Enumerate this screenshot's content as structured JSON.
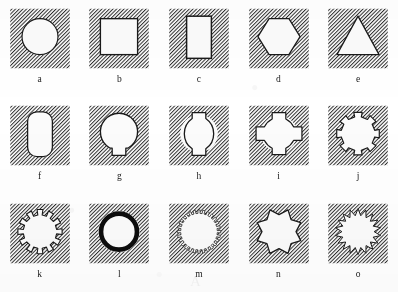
{
  "figure": {
    "rows": 3,
    "columns": 5,
    "background_color": "#ffffff",
    "hatch_color": "#2b2b2b",
    "outline_color": "#1a1a1a",
    "fill_color": "#fbfbfb"
  },
  "panels": [
    {
      "label": "a",
      "shape": "circle",
      "name": "circular-hole"
    },
    {
      "label": "b",
      "shape": "square",
      "name": "square-hole"
    },
    {
      "label": "c",
      "shape": "rectangle-vertical",
      "name": "vertical-rectangular-hole"
    },
    {
      "label": "d",
      "shape": "hexagon",
      "name": "hexagonal-hole"
    },
    {
      "label": "e",
      "shape": "triangle",
      "name": "triangular-hole"
    },
    {
      "label": "f",
      "shape": "rounded-rectangle",
      "name": "rounded-rectangular-hole"
    },
    {
      "label": "g",
      "shape": "circle-with-tab",
      "name": "keyhole-hole"
    },
    {
      "label": "h",
      "shape": "circle-two-tabs",
      "name": "two-keyway-hole"
    },
    {
      "label": "i",
      "shape": "circle-four-lobes",
      "name": "four-keyway-hole"
    },
    {
      "label": "j",
      "shape": "circle-eight-lobes",
      "name": "eight-keyway-hole"
    },
    {
      "label": "k",
      "shape": "gear-twelve",
      "name": "twelve-tooth-gear-hole"
    },
    {
      "label": "l",
      "shape": "thick-ring",
      "name": "thick-walled-ring"
    },
    {
      "label": "m",
      "shape": "gear-fine",
      "name": "fine-tooth-gear-hole"
    },
    {
      "label": "n",
      "shape": "star-eight",
      "name": "eight-point-star-hole"
    },
    {
      "label": "o",
      "shape": "star-zigzag",
      "name": "zigzag-star-hole"
    }
  ],
  "ghost_text": {
    "line": "A"
  },
  "chart_data": {
    "type": "table",
    "categories": [
      "a",
      "b",
      "c",
      "d",
      "e",
      "f",
      "g",
      "h",
      "i",
      "j",
      "k",
      "l",
      "m",
      "n",
      "o"
    ],
    "values": [
      "circle",
      "square",
      "rectangle-vertical",
      "hexagon",
      "triangle",
      "rounded-rectangle",
      "circle-with-tab",
      "circle-two-tabs",
      "circle-four-lobes",
      "circle-eight-lobes",
      "gear-twelve",
      "thick-ring",
      "gear-fine",
      "star-eight",
      "star-zigzag"
    ],
    "xlabel": "panel",
    "ylabel": "profile",
    "grid": false,
    "legend": "none"
  }
}
